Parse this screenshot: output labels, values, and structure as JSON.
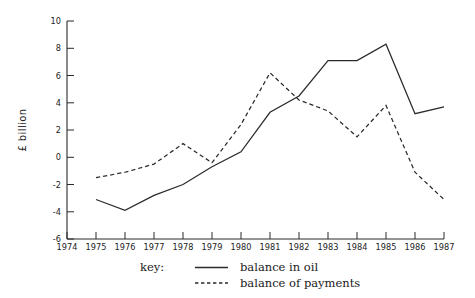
{
  "chart_data": {
    "type": "line",
    "title": "",
    "subtitle": "",
    "xlabel": "",
    "ylabel": "£ billion",
    "x": [
      1975,
      1976,
      1977,
      1978,
      1979,
      1980,
      1981,
      1982,
      1983,
      1984,
      1985,
      1986,
      1987
    ],
    "xlim": [
      1974,
      1987
    ],
    "ylim": [
      -6,
      10
    ],
    "xticks": [
      1974,
      1975,
      1976,
      1977,
      1978,
      1979,
      1980,
      1981,
      1982,
      1983,
      1984,
      1985,
      1986,
      1987
    ],
    "xtick_labels": [
      "1974",
      "1975",
      "1976",
      "1977",
      "1978",
      "1979",
      "1980",
      "1981",
      "1982",
      "1983",
      "1984",
      "1985",
      "1986",
      "1987"
    ],
    "yticks": [
      -6,
      -4,
      -2,
      0,
      2,
      4,
      6,
      8,
      10
    ],
    "ytick_labels": [
      "-6",
      "-4",
      "-2",
      "0",
      "2",
      "4",
      "6",
      "8",
      "10"
    ],
    "grid": false,
    "legend_position": "below-center",
    "legend_title": "key:",
    "series": [
      {
        "name": "balance in oil",
        "style": "solid",
        "color": "#2b2b2b",
        "values": [
          -3.1,
          -3.9,
          -2.8,
          -2.0,
          -0.7,
          0.4,
          3.3,
          4.5,
          7.1,
          7.1,
          8.3,
          3.2,
          3.7
        ]
      },
      {
        "name": "balance of payments",
        "style": "dashed",
        "color": "#2b2b2b",
        "values": [
          -1.5,
          -1.1,
          -0.5,
          1.0,
          -0.4,
          2.4,
          6.2,
          4.2,
          3.4,
          1.5,
          3.8,
          -1.1,
          -3.1
        ]
      }
    ]
  },
  "axes": {
    "y_axis_title": "£ billion",
    "y_tick_labels": [
      "10",
      "8",
      "6",
      "4",
      "2",
      "0",
      "-2",
      "-4",
      "-6"
    ],
    "x_tick_labels": [
      "1974",
      "1975",
      "1976",
      "1977",
      "1978",
      "1979",
      "1980",
      "1981",
      "1982",
      "1983",
      "1984",
      "1985",
      "1986",
      "1987"
    ]
  },
  "legend": {
    "key_label": "key:",
    "entries": [
      {
        "label": "balance in oil",
        "style": "solid"
      },
      {
        "label": "balance of payments",
        "style": "dashed"
      }
    ]
  }
}
